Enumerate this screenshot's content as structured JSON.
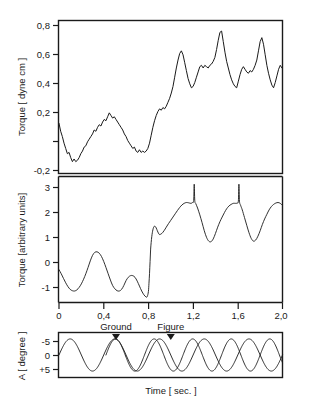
{
  "figure": {
    "caption_none": "",
    "xlabel": "Time [ sec. ]"
  },
  "panels": {
    "top": {
      "ylabel": "Torque [ dyne cm ]",
      "yticks": [
        "0,8",
        "0,6",
        "0,4",
        "0,2",
        "-0,2"
      ],
      "ytick_values": [
        0.8,
        0.6,
        0.4,
        0.2,
        -0.2
      ],
      "untick_value": 0.0
    },
    "middle": {
      "ylabel": "Torque [arbitrary units]",
      "yticks": [
        "3",
        "2",
        "1",
        "0",
        "-1"
      ],
      "ytick_values": [
        3,
        2,
        1,
        0,
        -1
      ]
    },
    "bottom": {
      "ylabel": "A [ degree ]",
      "yticks": [
        "-5",
        "0",
        "+5"
      ],
      "ytick_values": [
        -5,
        0,
        5
      ],
      "annotations": [
        {
          "label": "Ground",
          "time": 0.51
        },
        {
          "label": "Figure",
          "time": 1.0
        }
      ]
    }
  },
  "xaxis": {
    "ticks": [
      "0",
      "0,4",
      "0,8",
      "1,2",
      "1,6",
      "2,0"
    ],
    "tick_values": [
      0,
      0.4,
      0.8,
      1.2,
      1.6,
      2.0
    ],
    "min": 0,
    "max": 2.0
  },
  "colors": {
    "ink": "#1a1a1a",
    "background": "#ffffff"
  },
  "chart_data": [
    {
      "type": "line",
      "id": "panel-top",
      "title": "",
      "xlabel": "",
      "ylabel": "Torque [ dyne cm ]",
      "xlim": [
        0,
        2.0
      ],
      "ylim": [
        -0.28,
        0.88
      ],
      "grid": false,
      "legend": "none",
      "series": [
        {
          "name": "measured torque (noisy)",
          "x": [
            0.0,
            0.015,
            0.03,
            0.045,
            0.06,
            0.075,
            0.09,
            0.105,
            0.12,
            0.135,
            0.15,
            0.165,
            0.18,
            0.195,
            0.21,
            0.225,
            0.24,
            0.255,
            0.27,
            0.285,
            0.3,
            0.315,
            0.33,
            0.345,
            0.36,
            0.375,
            0.39,
            0.405,
            0.42,
            0.435,
            0.45,
            0.465,
            0.48,
            0.495,
            0.51,
            0.525,
            0.54,
            0.555,
            0.57,
            0.585,
            0.6,
            0.615,
            0.63,
            0.645,
            0.66,
            0.675,
            0.69,
            0.705,
            0.72,
            0.735,
            0.75,
            0.765,
            0.78,
            0.795,
            0.81,
            0.825,
            0.84,
            0.855,
            0.87,
            0.885,
            0.9,
            0.915,
            0.93,
            0.945,
            0.96,
            0.975,
            0.99,
            1.005,
            1.02,
            1.035,
            1.05,
            1.065,
            1.08,
            1.095,
            1.11,
            1.125,
            1.14,
            1.155,
            1.17,
            1.185,
            1.2,
            1.215,
            1.23,
            1.245,
            1.26,
            1.275,
            1.29,
            1.305,
            1.32,
            1.335,
            1.35,
            1.365,
            1.38,
            1.395,
            1.41,
            1.425,
            1.44,
            1.455,
            1.47,
            1.485,
            1.5,
            1.515,
            1.53,
            1.545,
            1.56,
            1.575,
            1.59,
            1.605,
            1.62,
            1.635,
            1.65,
            1.665,
            1.68,
            1.695,
            1.71,
            1.725,
            1.74,
            1.755,
            1.77,
            1.785,
            1.8,
            1.815,
            1.83,
            1.845,
            1.86,
            1.875,
            1.89,
            1.905,
            1.92,
            1.935,
            1.95,
            1.965,
            1.98,
            1.995
          ],
          "y": [
            0.1,
            0.04,
            0.0,
            -0.05,
            -0.09,
            -0.13,
            -0.12,
            -0.16,
            -0.19,
            -0.17,
            -0.19,
            -0.18,
            -0.16,
            -0.13,
            -0.11,
            -0.08,
            -0.07,
            -0.04,
            -0.02,
            0.0,
            0.02,
            0.05,
            0.04,
            0.07,
            0.09,
            0.08,
            0.11,
            0.13,
            0.12,
            0.15,
            0.18,
            0.16,
            0.14,
            0.15,
            0.13,
            0.11,
            0.09,
            0.07,
            0.05,
            0.02,
            0.0,
            -0.03,
            -0.05,
            -0.07,
            -0.09,
            -0.08,
            -0.11,
            -0.12,
            -0.1,
            -0.12,
            -0.11,
            -0.12,
            -0.11,
            -0.09,
            -0.05,
            0.01,
            0.07,
            0.12,
            0.16,
            0.19,
            0.21,
            0.2,
            0.22,
            0.21,
            0.23,
            0.26,
            0.29,
            0.33,
            0.38,
            0.45,
            0.52,
            0.58,
            0.63,
            0.65,
            0.62,
            0.56,
            0.5,
            0.44,
            0.4,
            0.37,
            0.38,
            0.41,
            0.45,
            0.49,
            0.53,
            0.54,
            0.52,
            0.54,
            0.53,
            0.52,
            0.54,
            0.55,
            0.57,
            0.6,
            0.66,
            0.73,
            0.79,
            0.8,
            0.72,
            0.64,
            0.57,
            0.52,
            0.47,
            0.43,
            0.4,
            0.38,
            0.37,
            0.42,
            0.47,
            0.51,
            0.53,
            0.51,
            0.49,
            0.48,
            0.5,
            0.49,
            0.51,
            0.54,
            0.58,
            0.65,
            0.72,
            0.75,
            0.7,
            0.62,
            0.54,
            0.48,
            0.43,
            0.39,
            0.37,
            0.41,
            0.46,
            0.51,
            0.54,
            0.52,
            0.54,
            0.53,
            0.55,
            0.57,
            0.56
          ]
        }
      ]
    },
    {
      "type": "line",
      "id": "panel-middle",
      "title": "",
      "xlabel": "",
      "ylabel": "Torque [arbitrary units]",
      "xlim": [
        0,
        2.0
      ],
      "ylim": [
        -1.1,
        3.5
      ],
      "grid": false,
      "legend": "none",
      "series": [
        {
          "name": "model torque (smooth)",
          "x": [
            0.0,
            0.02,
            0.04,
            0.06,
            0.08,
            0.1,
            0.12,
            0.14,
            0.16,
            0.18,
            0.2,
            0.22,
            0.24,
            0.26,
            0.28,
            0.3,
            0.32,
            0.34,
            0.36,
            0.38,
            0.4,
            0.42,
            0.44,
            0.46,
            0.48,
            0.5,
            0.52,
            0.54,
            0.56,
            0.58,
            0.6,
            0.62,
            0.64,
            0.66,
            0.68,
            0.7,
            0.72,
            0.74,
            0.76,
            0.78,
            0.79,
            0.8,
            0.805,
            0.81,
            0.815,
            0.82,
            0.83,
            0.84,
            0.85,
            0.86,
            0.87,
            0.88,
            0.89,
            0.9,
            0.92,
            0.94,
            0.96,
            0.98,
            1.0,
            1.02,
            1.04,
            1.06,
            1.08,
            1.1,
            1.12,
            1.14,
            1.16,
            1.18,
            1.195,
            1.205,
            1.21,
            1.215,
            1.225,
            1.24,
            1.26,
            1.28,
            1.3,
            1.32,
            1.34,
            1.36,
            1.38,
            1.4,
            1.42,
            1.44,
            1.46,
            1.48,
            1.5,
            1.52,
            1.54,
            1.56,
            1.58,
            1.595,
            1.605,
            1.61,
            1.615,
            1.625,
            1.64,
            1.66,
            1.68,
            1.7,
            1.72,
            1.74,
            1.76,
            1.78,
            1.8,
            1.82,
            1.84,
            1.86,
            1.88,
            1.9,
            1.92,
            1.94,
            1.96,
            1.98,
            2.0
          ],
          "y": [
            0.1,
            -0.05,
            -0.22,
            -0.38,
            -0.52,
            -0.62,
            -0.67,
            -0.68,
            -0.64,
            -0.55,
            -0.42,
            -0.25,
            -0.05,
            0.18,
            0.42,
            0.62,
            0.73,
            0.75,
            0.7,
            0.58,
            0.4,
            0.18,
            -0.05,
            -0.28,
            -0.48,
            -0.6,
            -0.67,
            -0.68,
            -0.62,
            -0.48,
            -0.3,
            -0.18,
            -0.12,
            -0.12,
            -0.18,
            -0.32,
            -0.5,
            -0.68,
            -0.82,
            -0.9,
            -0.88,
            -0.7,
            -0.4,
            -0.05,
            0.4,
            0.85,
            1.3,
            1.55,
            1.67,
            1.68,
            1.62,
            1.52,
            1.43,
            1.38,
            1.42,
            1.52,
            1.65,
            1.78,
            1.9,
            2.02,
            2.14,
            2.26,
            2.37,
            2.46,
            2.52,
            2.55,
            2.54,
            2.52,
            2.55,
            2.62,
            3.22,
            2.62,
            2.5,
            2.35,
            2.1,
            1.82,
            1.52,
            1.28,
            1.14,
            1.12,
            1.22,
            1.42,
            1.65,
            1.85,
            2.02,
            2.18,
            2.32,
            2.42,
            2.48,
            2.52,
            2.52,
            2.53,
            2.6,
            3.22,
            2.6,
            2.45,
            2.28,
            2.0,
            1.72,
            1.45,
            1.24,
            1.14,
            1.18,
            1.32,
            1.52,
            1.75,
            1.95,
            2.12,
            2.28,
            2.4,
            2.48,
            2.53,
            2.55,
            2.52,
            2.44
          ]
        }
      ]
    },
    {
      "type": "line",
      "id": "panel-bottom",
      "title": "",
      "xlabel": "Time [ sec. ]",
      "ylabel": "A [ degree ]",
      "xlim": [
        0,
        2.0
      ],
      "ylim": [
        -7,
        7
      ],
      "y_inverted": true,
      "grid": false,
      "legend": "none",
      "annotations": [
        "Ground",
        "Figure"
      ],
      "series": [
        {
          "name": "Ground",
          "amplitude": 5.0,
          "period": 0.4,
          "phase_deg": 0,
          "description": "sinusoid, minima (plotted high) at t = 0.11, 0.51, 0.91, 1.31, 1.71"
        },
        {
          "name": "Figure",
          "amplitude": 5.0,
          "period": 0.345,
          "phase_deg": 0,
          "start_time": 0.42,
          "description": "sinusoid starting near t = 0.42, minima (plotted high) at t = 0.60, 0.945, 1.29, 1.635, 1.98"
        }
      ]
    }
  ]
}
